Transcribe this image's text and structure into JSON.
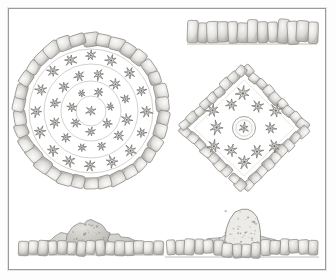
{
  "plate": {
    "title": "Stone-Edged Raised Garden Bed Designs",
    "medium": "graphite pencil drawing",
    "background_color": "#ffffff",
    "frame_color": "#9a9a9a",
    "stone_fill": "#e9e8e6",
    "stone_stroke": "#8e8c88",
    "stone_shadow": "#b9b7b3",
    "plant_stroke": "#6f6d6a",
    "guide_line_color": "#c9c7c4",
    "foliage_fill": "#cfcdc9"
  },
  "figures": [
    {
      "id": "circular-bed-plan",
      "name": "Circular raised bed, plan view",
      "view": "plan",
      "shape": "circle",
      "border_stone_count": 34,
      "guide_rings": 4,
      "plant_rings": [
        {
          "ring": "outer",
          "count": 16,
          "symbol": "star-plant"
        },
        {
          "ring": "middle",
          "count": 12,
          "symbol": "star-plant"
        },
        {
          "ring": "inner",
          "count": 7,
          "symbol": "star-plant"
        }
      ]
    },
    {
      "id": "stone-border-strip-elevation",
      "name": "Stone border course, straight elevation",
      "view": "elevation",
      "shape": "strip",
      "stone_count": 13
    },
    {
      "id": "diamond-bed-plan",
      "name": "Square raised bed set on the diagonal, plan view",
      "view": "plan",
      "shape": "diamond",
      "border_stone_count": 36,
      "center_medallion": true,
      "plant_count": 12,
      "plant_symbol": "star-plant"
    },
    {
      "id": "left-section-elevation",
      "name": "Low mounded planting section, left elevation",
      "view": "elevation",
      "shape": "section",
      "stone_count": 15,
      "mound": "broad low shrub mass"
    },
    {
      "id": "right-section-elevation",
      "name": "Tall central specimen section, right elevation",
      "view": "elevation",
      "shape": "section",
      "stone_count": 16,
      "mound": "tall columnar specimen"
    }
  ],
  "chart_data": {
    "type": "table",
    "categories": [
      "Circular bed (plan)",
      "Border course (elevation)",
      "Diamond bed (plan)",
      "Left section (elevation)",
      "Right section (elevation)"
    ],
    "series": [
      {
        "name": "Edging stones",
        "values": [
          34,
          13,
          36,
          15,
          16
        ]
      },
      {
        "name": "Plant symbols",
        "values": [
          35,
          0,
          12,
          0,
          0
        ]
      }
    ],
    "xlabel": "",
    "ylabel": "",
    "legend_position": "none",
    "grid": false
  }
}
